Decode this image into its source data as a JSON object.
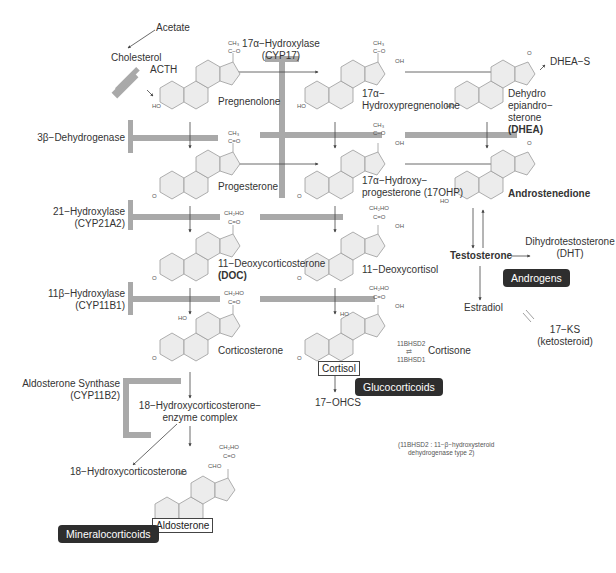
{
  "precursors": {
    "acetate": "Acetate",
    "cholesterol": "Cholesterol",
    "acth": "ACTH"
  },
  "enzymes": {
    "cyp17": {
      "name": "17α−Hydroxylase",
      "code": "(CYP17)"
    },
    "hsd3b": {
      "name": "3β−Dehydrogenase"
    },
    "cyp21": {
      "name": "21−Hydroxylase",
      "code": "(CYP21A2)"
    },
    "cyp11b1": {
      "name": "11β−Hydroxylase",
      "code": "(CYP11B1)"
    },
    "cyp11b2": {
      "name": "Aldosterone Synthase",
      "code": "(CYP11B2)"
    }
  },
  "compounds": {
    "pregnenolone": "Pregnenolone",
    "hydroxypregnenolone_1": "17α−",
    "hydroxypregnenolone_2": "Hydroxypregnenolone",
    "dhea_1": "Dehydro",
    "dhea_2": "epiandro−",
    "dhea_3": "sterone",
    "dhea_abbr": "(DHEA)",
    "dhea_s": "DHEA−S",
    "progesterone": "Progesterone",
    "ohp_1": "17α−Hydroxy−",
    "ohp_2": "progesterone (17OHP)",
    "androstenedione": "Androstenedione",
    "doc_1": "11−Deoxycorticosterone",
    "doc_abbr": "(DOC)",
    "deoxycortisol": "11−Deoxycortisol",
    "testosterone": "Testosterone",
    "dht_1": "Dihydrotestosterone",
    "dht_2": "(DHT)",
    "estradiol": "Estradiol",
    "corticosterone": "Corticosterone",
    "cortisol": "Cortisol",
    "cortisone": "Cortisone",
    "hsd2": "11BHSD2",
    "hsd1": "11BHSD1",
    "ohcs": "17−OHCS",
    "ks_1": "17−KS",
    "ks_2": "(ketosteroid)",
    "hcs18_complex_1": "18−Hydroxycorticosterone−",
    "hcs18_complex_2": "enzyme complex",
    "hcs18": "18−Hydroxycorticosterone",
    "aldosterone": "Aldosterone"
  },
  "groups": {
    "androgens": "Androgens",
    "glucocorticoids": "Glucocorticoids",
    "mineralocorticoids": "Mineralocorticoids"
  },
  "substituents": {
    "ch3": "CH₃",
    "co": "C−O",
    "cdo": "C=O",
    "oh": "OH",
    "ho": "HO",
    "o": "O",
    "ch2oh": "CH₂HO",
    "cho": "CHO"
  },
  "footnote": {
    "line1": "(11BHSD2 : 11−β−hydroxysteroid",
    "line2": "dehydrogenase type 2)"
  },
  "colors": {
    "block_bar": "#a9a9a9",
    "ring_fill": "#ececec",
    "ring_stroke": "#9a9a9a",
    "arrow": "#444444",
    "pill_bg": "#2e2e2e"
  }
}
